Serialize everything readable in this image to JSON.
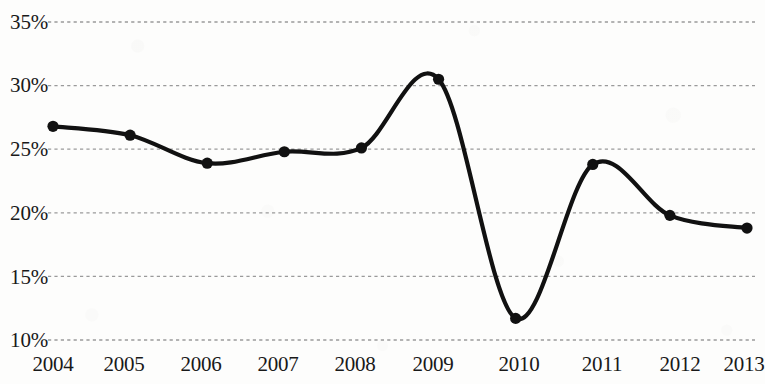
{
  "chart_data": {
    "type": "line",
    "title": "",
    "subtitle": "",
    "xlabel": "",
    "ylabel": "",
    "categories": [
      "2004",
      "2005",
      "2006",
      "2007",
      "2008",
      "2009",
      "2010",
      "2011",
      "2012",
      "2013"
    ],
    "values": [
      26.8,
      26.1,
      23.9,
      24.8,
      25.1,
      30.5,
      11.7,
      23.8,
      19.8,
      18.8
    ],
    "series": [
      {
        "name": "",
        "values": [
          26.8,
          26.1,
          23.9,
          24.8,
          25.1,
          30.5,
          11.7,
          23.8,
          19.8,
          18.8
        ]
      }
    ],
    "ylim": [
      10,
      35
    ],
    "xlim": [
      "2004",
      "2013"
    ],
    "y_ticks": [
      35,
      30,
      25,
      20,
      15,
      10
    ],
    "y_tick_labels": [
      "35%",
      "30%",
      "25%",
      "20%",
      "15%",
      "10%"
    ],
    "x_tick_labels": [
      "2004",
      "2005",
      "2006",
      "2007",
      "2008",
      "2009",
      "2010",
      "2011",
      "2012",
      "2013"
    ],
    "grid": "horizontal-dashed",
    "legend": "none",
    "line_color": "#111111",
    "marker_color": "#111111",
    "gridline_color": "#9a9a9a",
    "smoothing": "spline",
    "annotations": []
  },
  "axis": {
    "y_labels": [
      "35%",
      "30%",
      "25%",
      "20%",
      "15%",
      "10%"
    ],
    "x_labels": [
      "2004",
      "2005",
      "2006",
      "2007",
      "2008",
      "2009",
      "2010",
      "2011",
      "2012",
      "2013"
    ]
  }
}
